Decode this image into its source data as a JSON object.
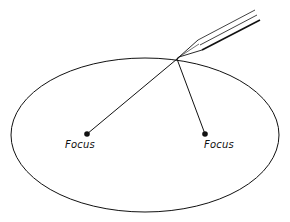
{
  "diagram": {
    "foci": [
      {
        "label": "Focus",
        "x": 87,
        "y": 134
      },
      {
        "label": "Focus",
        "x": 205,
        "y": 134
      }
    ],
    "pencil_tip": {
      "x": 177,
      "y": 59
    },
    "ellipse": {
      "cx": 145,
      "cy": 135,
      "rx": 134,
      "ry": 77
    },
    "colors": {
      "ink": "#111111",
      "background": "#ffffff"
    }
  }
}
